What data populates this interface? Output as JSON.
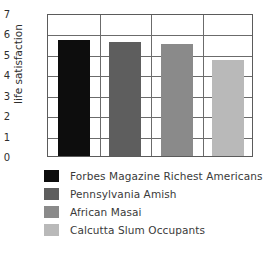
{
  "chart_data": {
    "type": "bar",
    "title": "",
    "xlabel": "",
    "ylabel": "life satisfaction",
    "ylim": [
      0,
      7
    ],
    "yticks": [
      7,
      6,
      5,
      4,
      3,
      2,
      1,
      0
    ],
    "grid": true,
    "legend_position": "below",
    "categories": [
      "Forbes Magazine Richest Americans",
      "Pennsylvania Amish",
      "African Masai",
      "Calcutta Slum Occupants"
    ],
    "values": [
      5.7,
      5.6,
      5.5,
      4.7
    ],
    "colors": [
      "#0d0d0d",
      "#5e5e5e",
      "#8a8a8a",
      "#b9b9b9"
    ]
  },
  "figure": {
    "title_fragment": "",
    "axis": {
      "y_title": "life satisfaction",
      "y_tick_labels": [
        "7",
        "6",
        "5",
        "4",
        "3",
        "2",
        "1",
        "0"
      ]
    },
    "legend": {
      "entries": [
        {
          "label": "Forbes Magazine Richest Americans",
          "color": "#0d0d0d"
        },
        {
          "label": "Pennsylvania Amish",
          "color": "#5e5e5e"
        },
        {
          "label": "African Masai",
          "color": "#8a8a8a"
        },
        {
          "label": "Calcutta Slum Occupants",
          "color": "#b9b9b9"
        }
      ]
    }
  }
}
